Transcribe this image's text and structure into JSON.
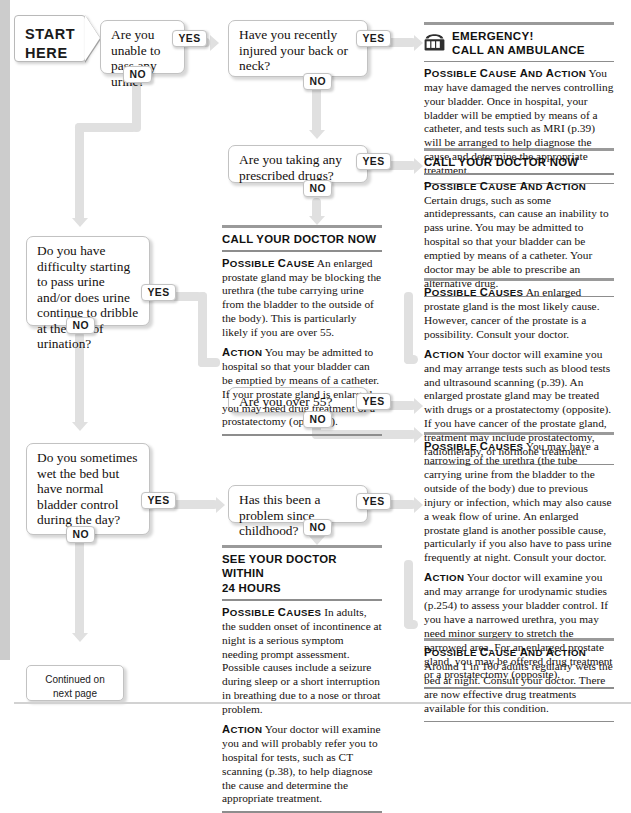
{
  "start": {
    "line1": "START",
    "line2": "HERE"
  },
  "questions": [
    {
      "id": "q1",
      "text": "Are you unable to pass any urine?",
      "yes": "YES",
      "no": "NO"
    },
    {
      "id": "q2",
      "text": "Have you recently injured your back or neck?",
      "yes": "YES",
      "no": "NO"
    },
    {
      "id": "q3",
      "text": "Are you taking any prescribed drugs?",
      "yes": "YES",
      "no": "NO"
    },
    {
      "id": "q4",
      "text": "Do you have difficulty starting to pass urine and/or does urine continue to dribble at the end of urination?",
      "yes": "YES",
      "no": "NO"
    },
    {
      "id": "q5",
      "text": "Are you over 55?",
      "yes": "YES",
      "no": "NO"
    },
    {
      "id": "q6",
      "text": "Do you sometimes wet the bed but have normal bladder control during the day?",
      "yes": "YES",
      "no": "NO"
    },
    {
      "id": "q7",
      "text": "Has this been a problem since childhood?",
      "yes": "YES",
      "no": "NO"
    }
  ],
  "panels": {
    "emergency": {
      "icon": "telephone-icon",
      "head_line1": "EMERGENCY!",
      "head_line2": "CALL AN AMBULANCE",
      "para1_lead": "Possible cause and action",
      "para1_text": "You may have damaged the nerves controlling your bladder. Once in hospital, your bladder will be emptied by means of a catheter, and tests such as MRI (p.39) will be arranged to help diagnose the cause and determine the appropriate treatment."
    },
    "doctor_now_right": {
      "head": "CALL YOUR DOCTOR NOW",
      "para1_lead": "Possible cause and action",
      "para1_text": "Certain drugs, such as some antidepressants, can cause an inability to pass urine. You may be admitted to hospital so that your bladder can be emptied by means of a catheter. Your doctor may be able to prescribe an alternative drug."
    },
    "prostate": {
      "para1_lead": "Possible causes",
      "para1_text": "An enlarged prostate gland is the most likely cause. However, cancer of the prostate is a possibility. Consult your doctor.",
      "para2_lead": "Action",
      "para2_text": "Your doctor will examine you and may arrange tests such as blood tests and ultrasound scanning (p.39). An enlarged prostate gland may be treated with drugs or a prostatectomy (opposite). If you have cancer of the prostate gland, treatment may include prostatectomy, radiotherapy, or hormone treatment."
    },
    "urethra": {
      "para1_lead": "Possible causes",
      "para1_text": "You may have a narrowing of the urethra (the tube carrying urine from the bladder to the outside of the body) due to previous injury or infection, which may also cause a weak flow of urine. An enlarged prostate gland is another possible cause, particularly if you also have to pass urine frequently at night. Consult your doctor.",
      "para2_lead": "Action",
      "para2_text": "Your doctor will examine you and may arrange for urodynamic studies (p.254) to assess your bladder control. If you have a narrowed urethra, you may need minor surgery to stretch the narrowed area. For an enlarged prostate gland, you may be offered drug treatment or a prostatectomy (opposite)."
    },
    "bedwetting": {
      "para1_lead": "Possible cause and action",
      "para1_text": "Around 1 in 100 adults regularly wets the bed at night. Consult your doctor. There are now effective drug treatments available for this condition."
    },
    "doctor_now_middle": {
      "head": "CALL YOUR DOCTOR NOW",
      "para1_lead": "Possible cause",
      "para1_text": "An enlarged prostate gland may be blocking the urethra (the tube carrying urine from the bladder to the outside of the body). This is particularly likely if you are over 55.",
      "para2_lead": "Action",
      "para2_text": "You may be admitted to hospital so that your bladder can be emptied by means of a catheter. If your prostate gland is enlarged, you may need drug treatment or a prostatectomy (opposite)."
    },
    "see_doctor_24h": {
      "head_line1": "SEE YOUR DOCTOR WITHIN",
      "head_line2": "24 HOURS",
      "para1_lead": "Possible causes",
      "para1_text": "In adults, the sudden onset of incontinence at night is a serious symptom needing prompt assessment. Possible causes include a seizure during sleep or a short interruption in breathing due to a nose or throat problem.",
      "para2_lead": "Action",
      "para2_text": "Your doctor will examine you and will probably refer you to hospital for tests, such as CT scanning (p.38), to help diagnose the cause and determine the appropriate treatment."
    }
  },
  "continued": {
    "line1": "Continued on",
    "line2": "next page"
  },
  "colors": {
    "connector": "#e0e0e0",
    "rule": "#9a9a9a",
    "gutter": "#cccccc"
  }
}
